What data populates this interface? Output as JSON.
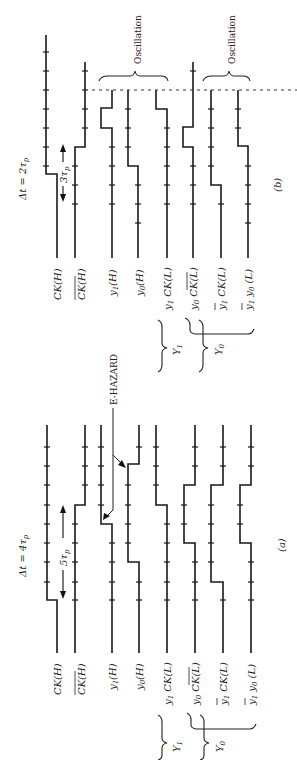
{
  "figure": {
    "orientation": "rotated 90 degrees counter-clockwise",
    "panels": [
      {
        "id": "b",
        "caption": "(b)",
        "delta_t_label": "Δt = 2τp",
        "delta_t_text": "Δt  = 2τ",
        "delta_t_sub": "p",
        "interval_label": "3τp",
        "interval_text": "3τ",
        "interval_sub": "p",
        "annotation": "Oscillation",
        "annotation2": "Oscillation",
        "signals": [
          "CK(H)",
          "CK̄(H)",
          "y1(H)",
          "y0(H)",
          "y1 CK(L)",
          "y0 CK̄(L)",
          "ȳ1 CK(L)",
          "ȳ1 y0(L)"
        ],
        "groups": [
          {
            "label": "Y1",
            "members": [
              "y1 CK(L)",
              "y0 CK̄(L)"
            ]
          },
          {
            "label": "Y0",
            "members": [
              "y0 CK̄(L)",
              "ȳ1 CK(L)",
              "ȳ1 y0(L)"
            ]
          }
        ]
      },
      {
        "id": "a",
        "caption": "(a)",
        "delta_t_label": "Δt = 4τp",
        "delta_t_text": "Δt  = 4τ",
        "delta_t_sub": "p",
        "interval_label": "5τp",
        "interval_text": "5τ",
        "interval_sub": "p",
        "annotation": "E-HAZARD",
        "signals": [
          "CK(H)",
          "CK̄(H)",
          "y1(H)",
          "y0(H)",
          "y1 CK(L)",
          "y0 CK̄(L)",
          "ȳ1 CK(L)",
          "ȳ1 y0(L)"
        ],
        "groups": [
          {
            "label": "Y1",
            "members": [
              "y1 CK(L)",
              "y0 CK̄(L)"
            ]
          },
          {
            "label": "Y0",
            "members": [
              "y0 CK̄(L)",
              "ȳ1 CK(L)",
              "ȳ1 y0(L)"
            ]
          }
        ]
      }
    ],
    "labels": {
      "ck_h": "CK(H)",
      "ckbar_h": "CK(H)",
      "y1_h": "y",
      "y1_h_sub": "1",
      "y1_h_tail": "(H)",
      "y0_h": "y",
      "y0_h_sub": "0",
      "y0_h_tail": "(H)",
      "y1ck_l": "y",
      "y1ck_l_sub": "1",
      "y1ck_l_tail": " CK(L)",
      "y0ckbar_l": "y",
      "y0ckbar_l_sub": "0",
      "y0ckbar_l_tail": " CK(L)",
      "y1barck_l": "y",
      "y1barck_l_sub": "1",
      "y1barck_l_tail": " CK(L)",
      "y1bary0_l": "y",
      "y1bary0_l_sub": "1",
      "y1bary0_l_mid": " y",
      "y1bary0_l_sub2": "0",
      "y1bary0_l_tail": " (L)",
      "group_Y1": "Y",
      "group_Y1_sub": "1",
      "group_Y0": "Y",
      "group_Y0_sub": "0"
    }
  }
}
